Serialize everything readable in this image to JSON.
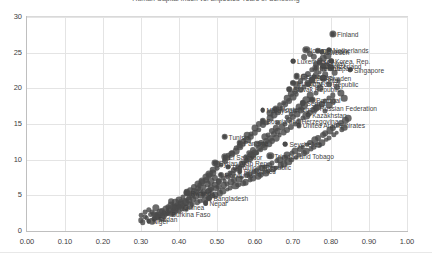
{
  "chart_data": {
    "type": "scatter",
    "title": "Human Capital Index vs. Expected Years of Schooling",
    "xlabel": "",
    "ylabel": "",
    "xlim": [
      0.0,
      1.0
    ],
    "ylim": [
      0,
      30
    ],
    "grid": true,
    "legend": "none",
    "marker_color": "#4a4a4a",
    "gridline_color": "#e4e4e4",
    "frame_color": "#d9d9d9",
    "xticks": [
      "0.00",
      "0.10",
      "0.20",
      "0.30",
      "0.40",
      "0.50",
      "0.60",
      "0.70",
      "0.80",
      "0.90",
      "1.00"
    ],
    "xtick_values": [
      0.0,
      0.1,
      0.2,
      0.3,
      0.4,
      0.5,
      0.6,
      0.7,
      0.8,
      0.9,
      1.0
    ],
    "yticks": [
      "0",
      "5",
      "10",
      "15",
      "20",
      "25",
      "30"
    ],
    "ytick_values": [
      0,
      5,
      10,
      15,
      20,
      25,
      30
    ],
    "labeled_points": [
      {
        "name": "Finland",
        "x": 0.805,
        "y": 27.6
      },
      {
        "name": "Netherlands",
        "x": 0.795,
        "y": 25.4
      },
      {
        "name": "Iceland",
        "x": 0.735,
        "y": 25.4
      },
      {
        "name": "Denmark",
        "x": 0.765,
        "y": 25.3
      },
      {
        "name": "Sweden",
        "x": 0.775,
        "y": 25.1
      },
      {
        "name": "Korea, Rep.",
        "x": 0.8,
        "y": 23.9
      },
      {
        "name": "Luxembourg",
        "x": 0.7,
        "y": 23.8
      },
      {
        "name": "Singapore",
        "x": 0.85,
        "y": 22.6
      },
      {
        "name": "Norway",
        "x": 0.77,
        "y": 23.6
      },
      {
        "name": "Switzerland",
        "x": 0.78,
        "y": 23.1
      },
      {
        "name": "Japan",
        "x": 0.8,
        "y": 22.9
      },
      {
        "name": "Ireland",
        "x": 0.76,
        "y": 22.8
      },
      {
        "name": "Germany",
        "x": 0.71,
        "y": 21.7
      },
      {
        "name": "Israel",
        "x": 0.755,
        "y": 21.6
      },
      {
        "name": "Sweden",
        "x": 0.78,
        "y": 21.4
      },
      {
        "name": "Estonia",
        "x": 0.75,
        "y": 21.2
      },
      {
        "name": "Hungary",
        "x": 0.7,
        "y": 20.8
      },
      {
        "name": "Czech Republic",
        "x": 0.74,
        "y": 20.6
      },
      {
        "name": "Slovak Republic",
        "x": 0.69,
        "y": 19.9
      },
      {
        "name": "Portugal",
        "x": 0.75,
        "y": 18.4
      },
      {
        "name": "Serbia",
        "x": 0.725,
        "y": 17.9
      },
      {
        "name": "Russian Federation",
        "x": 0.76,
        "y": 17.3
      },
      {
        "name": "Kazakhstan",
        "x": 0.74,
        "y": 16.3
      },
      {
        "name": "Montenegro",
        "x": 0.655,
        "y": 17.1
      },
      {
        "name": "Malaysia",
        "x": 0.62,
        "y": 16.9
      },
      {
        "name": "United Arab Emirates",
        "x": 0.715,
        "y": 14.8
      },
      {
        "name": "Bosnia and Herzegovina",
        "x": 0.62,
        "y": 15.4
      },
      {
        "name": "Tunisia",
        "x": 0.52,
        "y": 13.2
      },
      {
        "name": "Panama",
        "x": 0.56,
        "y": 12.4
      },
      {
        "name": "Seychelles",
        "x": 0.68,
        "y": 12.2
      },
      {
        "name": "Trinidad and Tobago",
        "x": 0.64,
        "y": 10.5
      },
      {
        "name": "El Salvador",
        "x": 0.52,
        "y": 10.4
      },
      {
        "name": "Syrian Arab Rep.",
        "x": 0.495,
        "y": 9.6
      },
      {
        "name": "Dominican Republic",
        "x": 0.53,
        "y": 9.0
      },
      {
        "name": "Philippines",
        "x": 0.56,
        "y": 8.4
      },
      {
        "name": "Honduras",
        "x": 0.51,
        "y": 7.9
      },
      {
        "name": "Rwanda",
        "x": 0.42,
        "y": 5.3
      },
      {
        "name": "Bangladesh",
        "x": 0.48,
        "y": 4.6
      },
      {
        "name": "Nepal",
        "x": 0.47,
        "y": 3.9
      },
      {
        "name": "Guinea",
        "x": 0.4,
        "y": 3.4
      },
      {
        "name": "Burkina Faso",
        "x": 0.37,
        "y": 2.4
      },
      {
        "name": "Sudan",
        "x": 0.335,
        "y": 1.7
      },
      {
        "name": "Niger",
        "x": 0.32,
        "y": 1.4
      }
    ],
    "points": [
      [
        0.805,
        27.6
      ],
      [
        0.795,
        25.4
      ],
      [
        0.735,
        25.4
      ],
      [
        0.765,
        25.3
      ],
      [
        0.775,
        25.1
      ],
      [
        0.8,
        23.9
      ],
      [
        0.7,
        23.8
      ],
      [
        0.85,
        22.6
      ],
      [
        0.77,
        23.6
      ],
      [
        0.78,
        23.1
      ],
      [
        0.8,
        22.9
      ],
      [
        0.76,
        22.8
      ],
      [
        0.71,
        21.7
      ],
      [
        0.755,
        21.6
      ],
      [
        0.78,
        21.4
      ],
      [
        0.75,
        21.2
      ],
      [
        0.7,
        20.8
      ],
      [
        0.74,
        20.6
      ],
      [
        0.69,
        19.9
      ],
      [
        0.75,
        18.4
      ],
      [
        0.725,
        17.9
      ],
      [
        0.76,
        17.3
      ],
      [
        0.74,
        16.3
      ],
      [
        0.655,
        17.1
      ],
      [
        0.62,
        16.9
      ],
      [
        0.715,
        14.8
      ],
      [
        0.62,
        15.4
      ],
      [
        0.52,
        13.2
      ],
      [
        0.56,
        12.4
      ],
      [
        0.68,
        12.2
      ],
      [
        0.64,
        10.5
      ],
      [
        0.52,
        10.4
      ],
      [
        0.495,
        9.6
      ],
      [
        0.53,
        9.0
      ],
      [
        0.56,
        8.4
      ],
      [
        0.51,
        7.9
      ],
      [
        0.42,
        5.3
      ],
      [
        0.48,
        4.6
      ],
      [
        0.47,
        3.9
      ],
      [
        0.4,
        3.4
      ],
      [
        0.37,
        2.4
      ],
      [
        0.335,
        1.7
      ],
      [
        0.32,
        1.4
      ],
      [
        0.3,
        1.5
      ],
      [
        0.31,
        2.0
      ],
      [
        0.325,
        2.3
      ],
      [
        0.34,
        2.1
      ],
      [
        0.355,
        2.8
      ],
      [
        0.365,
        3.1
      ],
      [
        0.345,
        1.9
      ],
      [
        0.33,
        2.6
      ],
      [
        0.38,
        3.6
      ],
      [
        0.39,
        2.9
      ],
      [
        0.405,
        4.0
      ],
      [
        0.415,
        3.3
      ],
      [
        0.425,
        4.4
      ],
      [
        0.435,
        3.8
      ],
      [
        0.445,
        4.9
      ],
      [
        0.455,
        4.2
      ],
      [
        0.465,
        5.4
      ],
      [
        0.475,
        4.7
      ],
      [
        0.485,
        5.8
      ],
      [
        0.495,
        5.1
      ],
      [
        0.505,
        6.2
      ],
      [
        0.515,
        5.6
      ],
      [
        0.525,
        6.6
      ],
      [
        0.535,
        6.0
      ],
      [
        0.545,
        7.1
      ],
      [
        0.555,
        6.5
      ],
      [
        0.565,
        7.5
      ],
      [
        0.575,
        6.9
      ],
      [
        0.585,
        8.0
      ],
      [
        0.595,
        7.4
      ],
      [
        0.605,
        8.5
      ],
      [
        0.615,
        7.9
      ],
      [
        0.625,
        9.0
      ],
      [
        0.635,
        8.4
      ],
      [
        0.645,
        9.5
      ],
      [
        0.655,
        8.9
      ],
      [
        0.665,
        10.0
      ],
      [
        0.675,
        9.4
      ],
      [
        0.685,
        10.6
      ],
      [
        0.695,
        10.0
      ],
      [
        0.705,
        11.2
      ],
      [
        0.715,
        10.6
      ],
      [
        0.725,
        11.8
      ],
      [
        0.735,
        11.2
      ],
      [
        0.745,
        12.4
      ],
      [
        0.755,
        11.8
      ],
      [
        0.765,
        13.0
      ],
      [
        0.775,
        12.4
      ],
      [
        0.785,
        13.7
      ],
      [
        0.795,
        13.1
      ],
      [
        0.805,
        14.4
      ],
      [
        0.815,
        13.8
      ],
      [
        0.825,
        15.1
      ],
      [
        0.835,
        14.5
      ],
      [
        0.845,
        15.8
      ],
      [
        0.305,
        1.2
      ],
      [
        0.315,
        1.8
      ],
      [
        0.335,
        2.4
      ],
      [
        0.35,
        2.6
      ],
      [
        0.36,
        2.2
      ],
      [
        0.37,
        3.0
      ],
      [
        0.385,
        3.3
      ],
      [
        0.395,
        3.7
      ],
      [
        0.408,
        3.1
      ],
      [
        0.418,
        4.1
      ],
      [
        0.428,
        3.6
      ],
      [
        0.438,
        4.5
      ],
      [
        0.448,
        4.0
      ],
      [
        0.458,
        5.0
      ],
      [
        0.468,
        4.4
      ],
      [
        0.478,
        5.5
      ],
      [
        0.488,
        4.9
      ],
      [
        0.498,
        6.0
      ],
      [
        0.508,
        5.3
      ],
      [
        0.518,
        6.4
      ],
      [
        0.528,
        5.8
      ],
      [
        0.538,
        6.9
      ],
      [
        0.548,
        6.3
      ],
      [
        0.558,
        7.3
      ],
      [
        0.568,
        6.7
      ],
      [
        0.578,
        7.8
      ],
      [
        0.588,
        7.2
      ],
      [
        0.598,
        8.3
      ],
      [
        0.608,
        7.7
      ],
      [
        0.618,
        8.8
      ],
      [
        0.628,
        8.2
      ],
      [
        0.638,
        9.3
      ],
      [
        0.648,
        8.7
      ],
      [
        0.658,
        9.8
      ],
      [
        0.668,
        9.2
      ],
      [
        0.678,
        10.3
      ],
      [
        0.688,
        9.7
      ],
      [
        0.698,
        10.9
      ],
      [
        0.708,
        10.3
      ],
      [
        0.718,
        11.5
      ],
      [
        0.728,
        10.9
      ],
      [
        0.738,
        12.1
      ],
      [
        0.748,
        11.5
      ],
      [
        0.758,
        12.7
      ],
      [
        0.768,
        12.1
      ],
      [
        0.778,
        13.4
      ],
      [
        0.788,
        12.8
      ],
      [
        0.798,
        14.1
      ],
      [
        0.808,
        13.5
      ],
      [
        0.818,
        14.8
      ],
      [
        0.828,
        14.2
      ],
      [
        0.838,
        15.5
      ],
      [
        0.45,
        6.0
      ],
      [
        0.46,
        6.8
      ],
      [
        0.47,
        7.2
      ],
      [
        0.48,
        7.8
      ],
      [
        0.49,
        8.2
      ],
      [
        0.5,
        8.8
      ],
      [
        0.51,
        9.2
      ],
      [
        0.52,
        9.8
      ],
      [
        0.53,
        10.2
      ],
      [
        0.54,
        10.8
      ],
      [
        0.55,
        11.2
      ],
      [
        0.56,
        11.8
      ],
      [
        0.57,
        12.2
      ],
      [
        0.58,
        12.8
      ],
      [
        0.59,
        13.2
      ],
      [
        0.6,
        13.8
      ],
      [
        0.61,
        14.2
      ],
      [
        0.62,
        14.8
      ],
      [
        0.63,
        15.2
      ],
      [
        0.64,
        15.8
      ],
      [
        0.65,
        16.2
      ],
      [
        0.66,
        16.8
      ],
      [
        0.67,
        17.2
      ],
      [
        0.68,
        17.8
      ],
      [
        0.69,
        18.2
      ],
      [
        0.7,
        18.8
      ],
      [
        0.71,
        19.2
      ],
      [
        0.72,
        19.8
      ],
      [
        0.73,
        20.2
      ],
      [
        0.74,
        20.8
      ],
      [
        0.75,
        21.2
      ],
      [
        0.76,
        21.8
      ],
      [
        0.77,
        22.2
      ],
      [
        0.78,
        22.8
      ],
      [
        0.79,
        23.2
      ],
      [
        0.8,
        23.8
      ],
      [
        0.43,
        5.2
      ],
      [
        0.44,
        5.6
      ],
      [
        0.455,
        6.4
      ],
      [
        0.465,
        6.2
      ],
      [
        0.475,
        6.6
      ],
      [
        0.485,
        7.0
      ],
      [
        0.495,
        7.4
      ],
      [
        0.505,
        7.0
      ],
      [
        0.515,
        7.4
      ],
      [
        0.525,
        7.8
      ],
      [
        0.535,
        8.2
      ],
      [
        0.545,
        8.6
      ],
      [
        0.555,
        9.0
      ],
      [
        0.565,
        9.4
      ],
      [
        0.575,
        9.8
      ],
      [
        0.585,
        10.2
      ],
      [
        0.595,
        10.6
      ],
      [
        0.605,
        11.0
      ],
      [
        0.615,
        11.4
      ],
      [
        0.625,
        11.8
      ],
      [
        0.635,
        12.2
      ],
      [
        0.645,
        12.6
      ],
      [
        0.655,
        13.0
      ],
      [
        0.665,
        13.4
      ],
      [
        0.675,
        13.8
      ],
      [
        0.685,
        14.2
      ],
      [
        0.695,
        14.6
      ],
      [
        0.705,
        15.0
      ],
      [
        0.715,
        15.4
      ],
      [
        0.725,
        15.8
      ],
      [
        0.735,
        16.2
      ],
      [
        0.745,
        16.6
      ],
      [
        0.755,
        17.0
      ],
      [
        0.765,
        17.4
      ],
      [
        0.775,
        17.8
      ],
      [
        0.785,
        18.2
      ],
      [
        0.795,
        18.6
      ],
      [
        0.805,
        19.0
      ],
      [
        0.7,
        16.0
      ],
      [
        0.71,
        16.4
      ],
      [
        0.72,
        17.0
      ],
      [
        0.73,
        17.6
      ],
      [
        0.69,
        15.6
      ],
      [
        0.68,
        15.0
      ],
      [
        0.67,
        14.6
      ],
      [
        0.66,
        14.0
      ],
      [
        0.65,
        13.6
      ],
      [
        0.64,
        13.0
      ],
      [
        0.63,
        12.6
      ],
      [
        0.62,
        12.0
      ],
      [
        0.61,
        11.6
      ],
      [
        0.6,
        11.0
      ],
      [
        0.59,
        10.6
      ],
      [
        0.58,
        10.0
      ],
      [
        0.57,
        9.6
      ],
      [
        0.56,
        9.0
      ],
      [
        0.55,
        8.6
      ],
      [
        0.54,
        8.0
      ],
      [
        0.53,
        7.6
      ],
      [
        0.52,
        7.0
      ],
      [
        0.36,
        2.5
      ],
      [
        0.37,
        2.7
      ],
      [
        0.38,
        2.4
      ],
      [
        0.39,
        3.2
      ],
      [
        0.4,
        2.8
      ],
      [
        0.41,
        3.5
      ],
      [
        0.42,
        3.0
      ],
      [
        0.345,
        2.2
      ],
      [
        0.355,
        1.9
      ],
      [
        0.365,
        2.3
      ],
      [
        0.375,
        2.9
      ],
      [
        0.385,
        2.6
      ],
      [
        0.395,
        3.4
      ],
      [
        0.405,
        3.8
      ],
      [
        0.415,
        4.2
      ],
      [
        0.425,
        4.6
      ],
      [
        0.435,
        5.0
      ],
      [
        0.445,
        5.4
      ],
      [
        0.455,
        5.8
      ],
      [
        0.465,
        5.2
      ],
      [
        0.475,
        5.6
      ],
      [
        0.485,
        6.1
      ],
      [
        0.495,
        6.5
      ],
      [
        0.505,
        6.9
      ],
      [
        0.78,
        24.2
      ],
      [
        0.79,
        24.6
      ],
      [
        0.77,
        24.0
      ],
      [
        0.76,
        23.4
      ],
      [
        0.75,
        22.6
      ],
      [
        0.74,
        22.0
      ],
      [
        0.73,
        21.6
      ],
      [
        0.72,
        21.0
      ],
      [
        0.71,
        20.4
      ],
      [
        0.705,
        19.6
      ],
      [
        0.695,
        19.2
      ],
      [
        0.685,
        18.6
      ],
      [
        0.675,
        18.0
      ],
      [
        0.665,
        17.6
      ],
      [
        0.73,
        24.4
      ],
      [
        0.745,
        24.8
      ],
      [
        0.755,
        24.4
      ],
      [
        0.785,
        22.0
      ],
      [
        0.81,
        22.2
      ],
      [
        0.82,
        21.0
      ],
      [
        0.795,
        20.6
      ],
      [
        0.77,
        20.0
      ],
      [
        0.76,
        19.4
      ],
      [
        0.745,
        19.0
      ],
      [
        0.735,
        18.4
      ],
      [
        0.725,
        18.0
      ],
      [
        0.715,
        17.4
      ],
      [
        0.705,
        16.8
      ],
      [
        0.695,
        16.4
      ],
      [
        0.685,
        16.0
      ],
      [
        0.5,
        9.4
      ],
      [
        0.49,
        8.6
      ],
      [
        0.48,
        8.0
      ],
      [
        0.47,
        7.6
      ],
      [
        0.46,
        7.0
      ],
      [
        0.45,
        6.6
      ],
      [
        0.44,
        6.2
      ],
      [
        0.43,
        5.8
      ],
      [
        0.42,
        5.4
      ],
      [
        0.41,
        4.8
      ],
      [
        0.4,
        4.4
      ],
      [
        0.39,
        4.0
      ],
      [
        0.38,
        4.2
      ],
      [
        0.37,
        3.4
      ],
      [
        0.6,
        14.4
      ],
      [
        0.61,
        15.0
      ],
      [
        0.59,
        13.6
      ],
      [
        0.58,
        13.4
      ],
      [
        0.57,
        12.6
      ],
      [
        0.56,
        12.0
      ],
      [
        0.55,
        11.6
      ],
      [
        0.54,
        11.0
      ],
      [
        0.53,
        10.6
      ],
      [
        0.52,
        10.0
      ],
      [
        0.64,
        16.6
      ],
      [
        0.65,
        17.0
      ],
      [
        0.66,
        15.2
      ],
      [
        0.655,
        14.4
      ],
      [
        0.645,
        14.0
      ],
      [
        0.635,
        13.4
      ],
      [
        0.625,
        13.2
      ],
      [
        0.615,
        12.4
      ],
      [
        0.605,
        12.2
      ],
      [
        0.595,
        11.4
      ],
      [
        0.585,
        11.0
      ],
      [
        0.575,
        10.4
      ],
      [
        0.815,
        20.2
      ],
      [
        0.825,
        19.4
      ],
      [
        0.835,
        18.6
      ],
      [
        0.805,
        18.2
      ],
      [
        0.795,
        17.6
      ],
      [
        0.785,
        16.8
      ],
      [
        0.3,
        2.2
      ],
      [
        0.31,
        2.6
      ],
      [
        0.32,
        3.0
      ],
      [
        0.33,
        1.4
      ],
      [
        0.34,
        3.2
      ]
    ]
  }
}
